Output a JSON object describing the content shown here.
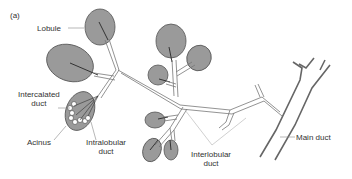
{
  "figure": {
    "panel_label": "(a)",
    "labels": {
      "lobule": "Lobule",
      "intercalated_1": "Intercalated",
      "intercalated_2": "duct",
      "acinus": "Acinus",
      "intralobular_1": "Intralobular",
      "intralobular_2": "duct",
      "interlobular_1": "Interlobular",
      "interlobular_2": "duct",
      "main_duct": "Main duct"
    },
    "colors": {
      "lobule_fill": "#9a9a9a",
      "lobule_stroke": "#555555",
      "duct_stroke": "#777777",
      "main_duct_stroke": "#666666",
      "leader_line": "#999999"
    }
  }
}
